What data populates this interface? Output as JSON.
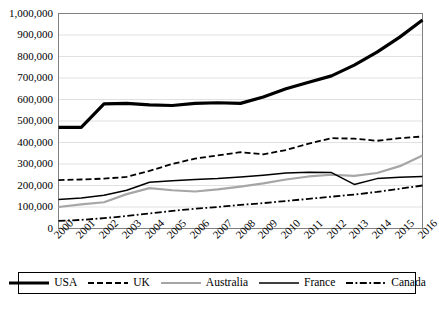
{
  "chart_data": {
    "type": "line",
    "title": "",
    "xlabel": "",
    "ylabel": "",
    "x": [
      2000,
      2001,
      2002,
      2003,
      2004,
      2005,
      2006,
      2007,
      2008,
      2009,
      2010,
      2011,
      2012,
      2013,
      2014,
      2015,
      2016
    ],
    "categories": [
      "2000",
      "2001",
      "2002",
      "2003",
      "2004",
      "2005",
      "2006",
      "2007",
      "2008",
      "2009",
      "2010",
      "2011",
      "2012",
      "2013",
      "2014",
      "2015",
      "2016"
    ],
    "ylim": [
      0,
      1000000
    ],
    "xlim": [
      2000,
      2016
    ],
    "yticks": [
      0,
      100000,
      200000,
      300000,
      400000,
      500000,
      600000,
      700000,
      800000,
      900000,
      1000000
    ],
    "ytick_labels": [
      "0",
      "100,000",
      "200,000",
      "300,000",
      "400,000",
      "500,000",
      "600,000",
      "700,000",
      "800,000",
      "900,000",
      "1,000,000"
    ],
    "grid": "horizontal",
    "legend_position": "bottom",
    "series": [
      {
        "name": "USA",
        "color": "#000000",
        "style": "solid-thick",
        "values": [
          470000,
          470000,
          580000,
          582000,
          575000,
          572000,
          582000,
          585000,
          582000,
          612000,
          650000,
          680000,
          710000,
          760000,
          820000,
          890000,
          970000
        ]
      },
      {
        "name": "UK",
        "color": "#000000",
        "style": "dashed",
        "values": [
          225000,
          228000,
          232000,
          240000,
          268000,
          300000,
          325000,
          340000,
          355000,
          345000,
          365000,
          395000,
          420000,
          418000,
          408000,
          420000,
          428000
        ]
      },
      {
        "name": "Australia",
        "color": "#a6a6a6",
        "style": "solid-medium",
        "values": [
          100000,
          112000,
          122000,
          160000,
          188000,
          178000,
          172000,
          182000,
          195000,
          210000,
          228000,
          242000,
          250000,
          245000,
          258000,
          290000,
          340000
        ]
      },
      {
        "name": "France",
        "color": "#000000",
        "style": "solid-thin",
        "values": [
          135000,
          142000,
          155000,
          178000,
          215000,
          222000,
          228000,
          232000,
          240000,
          248000,
          258000,
          262000,
          260000,
          205000,
          232000,
          238000,
          242000
        ]
      },
      {
        "name": "Canada",
        "color": "#000000",
        "style": "dash-dot",
        "values": [
          35000,
          40000,
          48000,
          58000,
          70000,
          82000,
          92000,
          100000,
          110000,
          118000,
          128000,
          138000,
          148000,
          158000,
          170000,
          185000,
          200000
        ]
      }
    ]
  },
  "legend": {
    "items": [
      {
        "label": "USA"
      },
      {
        "label": "UK"
      },
      {
        "label": "Australia"
      },
      {
        "label": "France"
      },
      {
        "label": "Canada"
      }
    ]
  }
}
